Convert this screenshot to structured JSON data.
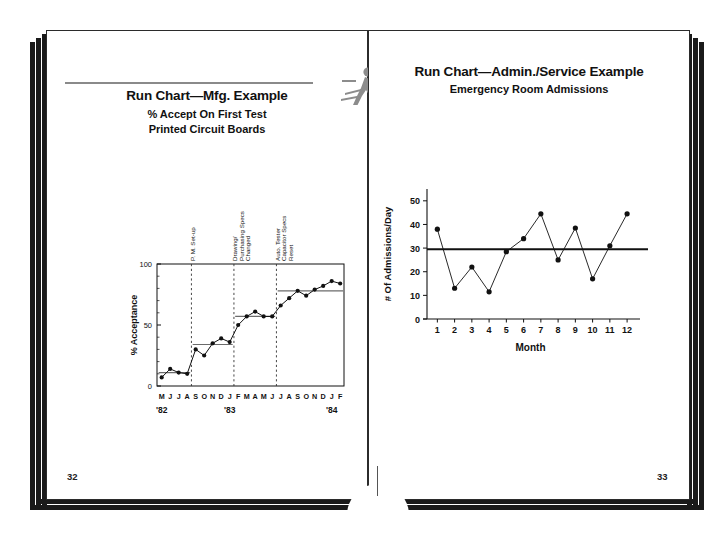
{
  "book": {
    "spread_pages": [
      "32",
      "33"
    ],
    "left_page_number": "32",
    "right_page_number": "33"
  },
  "left_page": {
    "title": "Run Chart—Mfg. Example",
    "subtitle1": "% Accept On First Test",
    "subtitle2": "Printed Circuit Boards",
    "icon": "running-figure-icon",
    "page_number": "32"
  },
  "right_page": {
    "title": "Run Chart—Admin./Service Example",
    "subtitle1": "Emergency Room Admissions",
    "page_number": "33"
  },
  "chart_data": [
    {
      "type": "line",
      "id": "mfg-run-chart",
      "title": "Run Chart—Mfg. Example",
      "subtitle": "% Accept On First Test / Printed Circuit Boards",
      "xlabel": "",
      "ylabel": "% Acceptance",
      "ylim": [
        0,
        100
      ],
      "yticks": [
        0,
        50,
        100
      ],
      "ytick_labels": [
        "0",
        "50",
        "100"
      ],
      "grid": false,
      "categories": [
        "M",
        "J",
        "J",
        "A",
        "S",
        "O",
        "N",
        "D",
        "J",
        "F",
        "M",
        "A",
        "M",
        "J",
        "J",
        "A",
        "S",
        "O",
        "N",
        "D",
        "J",
        "F"
      ],
      "year_labels": [
        {
          "label": "'82",
          "at_index": 0
        },
        {
          "label": "'83",
          "at_index": 8
        },
        {
          "label": "'84",
          "at_index": 20
        }
      ],
      "values": [
        7,
        14,
        11,
        10,
        30,
        25,
        35,
        39,
        36,
        50,
        57,
        61,
        57,
        57,
        66,
        72,
        78,
        74,
        79,
        82,
        86,
        84
      ],
      "median_segments": [
        {
          "value": 11,
          "from_index": 0,
          "to_index": 3,
          "label": "median-segment-1"
        },
        {
          "value": 34,
          "from_index": 4,
          "to_index": 8,
          "label": "median-segment-2"
        },
        {
          "value": 57,
          "from_index": 9,
          "to_index": 13,
          "label": "median-segment-3"
        },
        {
          "value": 78,
          "from_index": 14,
          "to_index": 21,
          "label": "median-segment-4"
        }
      ],
      "annotations": [
        {
          "text": "P. M. Set-up",
          "at_index": 3.5,
          "lines": [
            "P. M. Set-up"
          ]
        },
        {
          "text": "Drawing/ Purchasing Specs Changed",
          "at_index": 8.5,
          "lines": [
            "Drawing/",
            "Purchasing  Specs",
            "Changed"
          ]
        },
        {
          "text": "Auto. Tester Capacitor Specs Reset",
          "at_index": 13.5,
          "lines": [
            "Auto. Tester",
            "Capacitor Specs",
            "Reset"
          ]
        }
      ]
    },
    {
      "type": "line",
      "id": "er-run-chart",
      "title": "Run Chart—Admin./Service Example",
      "subtitle": "Emergency Room Admissions",
      "xlabel": "Month",
      "ylabel": "# Of Admissions/Day",
      "ylim": [
        0,
        55
      ],
      "yticks": [
        0,
        10,
        20,
        30,
        40,
        50
      ],
      "ytick_labels": [
        "0",
        "10",
        "20",
        "30",
        "40",
        "50"
      ],
      "grid": false,
      "categories": [
        "1",
        "2",
        "3",
        "4",
        "5",
        "6",
        "7",
        "8",
        "9",
        "10",
        "11",
        "12"
      ],
      "values": [
        38,
        13,
        22,
        11.5,
        28.5,
        34,
        44.5,
        25,
        38.5,
        17,
        31,
        44.5
      ],
      "median_line": {
        "value": 29.5,
        "label": "median-line"
      }
    }
  ],
  "colors": {
    "ink": "#111111",
    "page_edge": "#1a1a1a",
    "rule": "#8a8a8a",
    "median": "#6b6b6b",
    "median_dark": "#111111",
    "icon_gray": "#8c8c8c"
  }
}
